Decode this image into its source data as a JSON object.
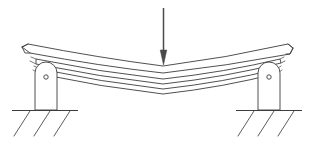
{
  "figure": {
    "kind": "engineering-mechanics-diagram",
    "background_color": "#ffffff",
    "line_color": "#3c3c3c",
    "accent_color": "#4a4a4a",
    "canvas": {
      "width": 313,
      "height": 141
    }
  },
  "load": {
    "name": "central-point-load",
    "direction": "down",
    "shaft_x": 163,
    "shaft_top_y": 8,
    "tip_y": 64,
    "head_width": 7,
    "head_height": 13,
    "label": ""
  },
  "beam": {
    "name": "laminated-curved-beam",
    "layer_count": 3,
    "edge_line_count": 4,
    "span_left_x": 26,
    "span_right_x": 290,
    "sag_depth_px": 17,
    "end_cut_angle": "oblique",
    "layers": [
      {
        "name": "top-leaf",
        "left_y": 49,
        "mid_y": 66,
        "right_y": 49
      },
      {
        "name": "middle-leaf",
        "left_y": 57,
        "mid_y": 74,
        "right_y": 57
      },
      {
        "name": "bottom-leaf",
        "left_y": 66,
        "mid_y": 82,
        "right_y": 66
      }
    ]
  },
  "supports": [
    {
      "name": "left-support",
      "type": "pinned-post",
      "post_x": 35,
      "post_width": 23,
      "post_top_y": 62,
      "post_bottom_y": 110,
      "cap_radius": 11,
      "pin_cx": 46,
      "pin_cy": 77,
      "pin_r": 2.2,
      "base_y": 110,
      "base_left_x": 12,
      "base_right_x": 78,
      "hatch_count": 3,
      "hatch_direction": "down-left"
    },
    {
      "name": "right-support",
      "type": "pinned-post",
      "post_x": 258,
      "post_width": 23,
      "post_top_y": 62,
      "post_bottom_y": 110,
      "cap_radius": 11,
      "pin_cx": 269,
      "pin_cy": 77,
      "pin_r": 2.2,
      "base_y": 110,
      "base_left_x": 236,
      "base_right_x": 302,
      "hatch_count": 3,
      "hatch_direction": "down-left"
    }
  ],
  "annotations": {
    "texts": []
  }
}
